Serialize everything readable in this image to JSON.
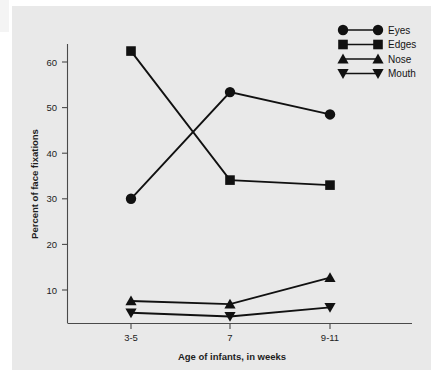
{
  "chart_data": {
    "type": "line",
    "title": "",
    "xlabel": "Age of infants, in weeks",
    "ylabel": "Percent of face fixations",
    "categories": [
      "3-5",
      "7",
      "9-11"
    ],
    "x_tick_labels": [
      "3-5",
      "7",
      "9-11"
    ],
    "y_tick_labels": [
      "10",
      "20",
      "30",
      "40",
      "50",
      "60"
    ],
    "y_ticks": [
      10,
      20,
      30,
      40,
      50,
      60
    ],
    "ylim": [
      2.7,
      65
    ],
    "grid": false,
    "legend_position": "top-right",
    "series": [
      {
        "name": "Eyes",
        "marker": "circle",
        "values": [
          30.0,
          53.4,
          48.5
        ]
      },
      {
        "name": "Edges",
        "marker": "square",
        "values": [
          62.4,
          34.1,
          33.0
        ]
      },
      {
        "name": "Nose",
        "marker": "triangle-up",
        "values": [
          7.6,
          6.9,
          12.7
        ]
      },
      {
        "name": "Mouth",
        "marker": "triangle-down",
        "values": [
          5.0,
          4.2,
          6.2
        ]
      }
    ],
    "colors": {
      "series": "#111111",
      "axis": "#4a4a4a",
      "plot_background": "#e9e9e9",
      "figure_background": "#ffffff"
    }
  },
  "legend": {
    "items": [
      {
        "label": "Eyes",
        "marker": "circle-marker"
      },
      {
        "label": "Edges",
        "marker": "square-marker"
      },
      {
        "label": "Nose",
        "marker": "triangle-up-marker"
      },
      {
        "label": "Mouth",
        "marker": "triangle-down-marker"
      }
    ]
  },
  "axes": {
    "y_title": "Percent of face fixations",
    "x_title": "Age of infants, in weeks",
    "y_labels": [
      "60",
      "50",
      "40",
      "30",
      "20",
      "10"
    ],
    "x_labels": [
      "3-5",
      "7",
      "9-11"
    ]
  }
}
